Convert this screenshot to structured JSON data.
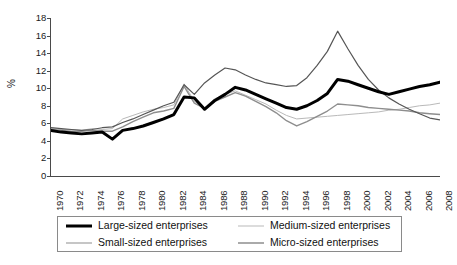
{
  "chart_data": {
    "type": "line",
    "title": "",
    "subtitle": "",
    "xlabel": "",
    "ylabel": "%",
    "ylim": [
      0,
      18
    ],
    "ytick_step": 2,
    "yticks": [
      18,
      16,
      14,
      12,
      10,
      8,
      6,
      4,
      2,
      0
    ],
    "grid": false,
    "legend_position": "bottom",
    "x": [
      1970,
      1971,
      1972,
      1973,
      1974,
      1975,
      1976,
      1977,
      1978,
      1979,
      1980,
      1981,
      1982,
      1983,
      1984,
      1985,
      1986,
      1987,
      1988,
      1989,
      1990,
      1991,
      1992,
      1993,
      1994,
      1995,
      1996,
      1997,
      1998,
      1999,
      2000,
      2001,
      2002,
      2003,
      2004,
      2005,
      2006,
      2007,
      2008
    ],
    "xticks": [
      "1970",
      "1972",
      "1974",
      "1976",
      "1978",
      "1980",
      "1982",
      "1984",
      "1986",
      "1988",
      "1990",
      "1992",
      "1994",
      "1996",
      "1998",
      "2000",
      "2002",
      "2004",
      "2006",
      "2008"
    ],
    "series": [
      {
        "name": "Large-sized enterprises",
        "color": "#000000",
        "width": 3.0,
        "values": [
          5.2,
          5.0,
          4.9,
          4.8,
          4.9,
          5.0,
          4.2,
          5.2,
          5.4,
          5.7,
          6.1,
          6.5,
          7.0,
          9.0,
          8.9,
          7.6,
          8.6,
          9.3,
          10.1,
          9.8,
          9.3,
          8.8,
          8.3,
          7.8,
          7.6,
          8.0,
          8.6,
          9.4,
          11.0,
          10.8,
          10.4,
          10.0,
          9.6,
          9.3,
          9.6,
          9.9,
          10.2,
          10.4,
          10.7
        ]
      },
      {
        "name": "Medium-sized enterprises",
        "color": "#b9b9b9",
        "width": 1.0,
        "values": [
          5.4,
          5.3,
          5.3,
          5.2,
          5.4,
          5.3,
          5.4,
          6.5,
          6.9,
          7.3,
          7.6,
          7.8,
          8.1,
          10.5,
          8.5,
          7.8,
          8.8,
          9.3,
          9.7,
          9.2,
          8.7,
          8.2,
          7.5,
          6.9,
          6.5,
          6.6,
          6.7,
          6.8,
          6.9,
          7.0,
          7.1,
          7.2,
          7.3,
          7.5,
          7.6,
          7.8,
          8.0,
          8.1,
          8.3
        ]
      },
      {
        "name": "Small-sized enterprises",
        "color": "#8e8e8e",
        "width": 1.4,
        "values": [
          5.3,
          5.2,
          5.1,
          5.1,
          5.2,
          5.1,
          5.1,
          5.6,
          6.2,
          6.7,
          7.2,
          7.4,
          7.7,
          10.2,
          8.3,
          7.7,
          8.5,
          9.0,
          9.5,
          9.1,
          8.5,
          7.9,
          7.2,
          6.3,
          5.7,
          6.2,
          6.8,
          7.4,
          8.2,
          8.1,
          8.0,
          7.8,
          7.7,
          7.6,
          7.5,
          7.4,
          7.2,
          7.1,
          7.0
        ]
      },
      {
        "name": "Micro-sized enterprises",
        "color": "#565656",
        "width": 1.2,
        "values": [
          5.5,
          5.4,
          5.3,
          5.2,
          5.3,
          5.5,
          5.6,
          6.1,
          6.5,
          7.0,
          7.5,
          8.0,
          8.4,
          10.4,
          9.3,
          10.6,
          11.5,
          12.3,
          12.1,
          11.5,
          11.0,
          10.6,
          10.4,
          10.2,
          10.3,
          11.2,
          12.6,
          14.2,
          16.5,
          14.5,
          12.6,
          11.0,
          9.8,
          8.9,
          8.2,
          7.6,
          7.1,
          6.6,
          6.4
        ]
      }
    ]
  },
  "legend": {
    "entries": [
      {
        "label": "Large-sized enterprises"
      },
      {
        "label": "Medium-sized enterprises"
      },
      {
        "label": "Small-sized enterprises"
      },
      {
        "label": "Micro-sized enterprises"
      }
    ]
  },
  "axes": {
    "y_title": "%"
  }
}
